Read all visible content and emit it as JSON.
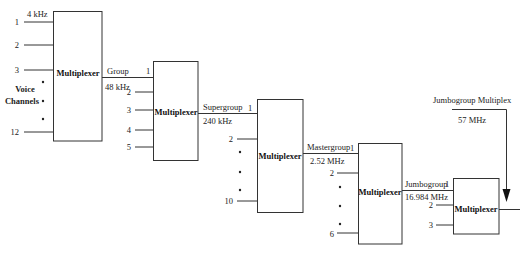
{
  "diagram": {
    "input_frequency": "4 kHz",
    "input_channels_label": [
      "Voice",
      "Channels"
    ],
    "multiplexers": [
      {
        "label": "Multiplexer",
        "ports": [
          "1",
          "2",
          "3",
          "12"
        ]
      },
      {
        "label": "Multiplexer",
        "ports": [
          "1",
          "2",
          "3",
          "4",
          "5"
        ]
      },
      {
        "label": "Multiplexer",
        "ports": [
          "1",
          "2",
          "10"
        ]
      },
      {
        "label": "Multiplexer",
        "ports": [
          "1",
          "2",
          "6"
        ]
      },
      {
        "label": "Multiplexer",
        "ports": [
          "1",
          "2",
          "3"
        ]
      }
    ],
    "links": [
      {
        "name": "Group",
        "frequency": "48 kHz"
      },
      {
        "name": "Supergroup",
        "frequency": "240 kHz"
      },
      {
        "name": "Mastergroup",
        "frequency": "2.52 MHz"
      },
      {
        "name": "Jumbogroup",
        "frequency": "16.984 MHz"
      }
    ],
    "jumbogroup_multiplex": {
      "label": "Jumbogroup Multiplex",
      "frequency": "57 MHz"
    }
  }
}
